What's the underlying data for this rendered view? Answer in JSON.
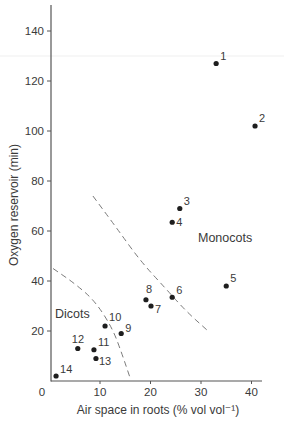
{
  "chart_data": {
    "type": "scatter",
    "title": "",
    "xlabel": "Air space in roots (% vol vol⁻¹)",
    "ylabel": "Oxygen reservoir (min)",
    "xlim": [
      0,
      44
    ],
    "ylim": [
      0,
      150
    ],
    "x_ticks": [
      0,
      10,
      20,
      30,
      40
    ],
    "y_ticks": [
      20,
      40,
      60,
      80,
      100,
      120,
      140
    ],
    "grid": false,
    "legend": null,
    "points": [
      {
        "id": "1",
        "x": 33.0,
        "y": 127
      },
      {
        "id": "2",
        "x": 40.7,
        "y": 102
      },
      {
        "id": "3",
        "x": 25.8,
        "y": 69
      },
      {
        "id": "4",
        "x": 24.3,
        "y": 63.5
      },
      {
        "id": "5",
        "x": 35.0,
        "y": 38
      },
      {
        "id": "6",
        "x": 24.3,
        "y": 33.5
      },
      {
        "id": "7",
        "x": 20.1,
        "y": 30
      },
      {
        "id": "8",
        "x": 19.1,
        "y": 32.5
      },
      {
        "id": "9",
        "x": 14.2,
        "y": 19
      },
      {
        "id": "10",
        "x": 11.0,
        "y": 22
      },
      {
        "id": "11",
        "x": 8.8,
        "y": 12.5
      },
      {
        "id": "12",
        "x": 5.6,
        "y": 13
      },
      {
        "id": "13",
        "x": 9.2,
        "y": 9
      },
      {
        "id": "14",
        "x": 1.3,
        "y": 2
      }
    ],
    "annotations": [
      {
        "text": "Monocots",
        "x": 29,
        "y": 58
      },
      {
        "text": "Dicots",
        "x": 2,
        "y": 27
      }
    ],
    "boundary_curves": [
      {
        "name": "monocot-boundary",
        "style": "dashed",
        "points": [
          [
            8.6,
            74
          ],
          [
            13,
            62
          ],
          [
            18,
            48
          ],
          [
            23,
            37
          ],
          [
            27,
            28
          ],
          [
            31.4,
            20
          ]
        ]
      },
      {
        "name": "dicot-boundary",
        "style": "dashed",
        "points": [
          [
            0.7,
            45
          ],
          [
            5,
            39
          ],
          [
            9,
            32
          ],
          [
            12.5,
            21
          ],
          [
            14.5,
            10
          ],
          [
            15.9,
            1.6
          ]
        ]
      }
    ]
  },
  "labels": {
    "x_axis_title": "Air space in roots (% vol vol⁻¹)",
    "y_axis_title": "Oxygen reservoir (min)",
    "monocots": "Monocots",
    "dicots": "Dicots"
  },
  "colors": {
    "point": "#1e1e1e",
    "axis": "#555555",
    "dash": "#7a7a7a",
    "text": "#3a3a3a"
  }
}
